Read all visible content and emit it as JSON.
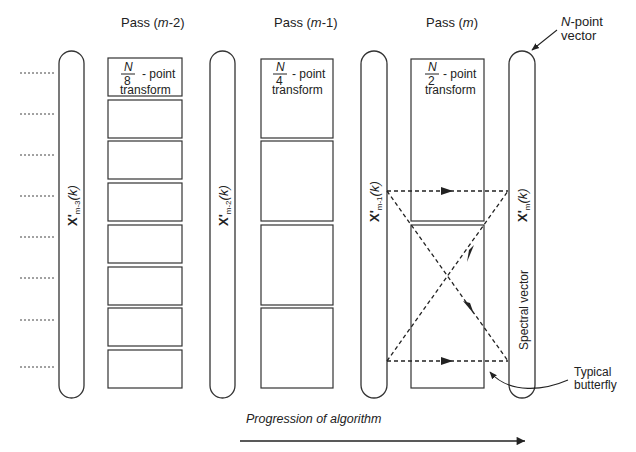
{
  "passes": [
    {
      "label": "Pass (m-2)",
      "prefix": "Pass ",
      "arg": "m",
      "suffix": "-2",
      "transform_num": "N",
      "transform_den": "8",
      "transform_word": "- point",
      "transform_line2": "transform"
    },
    {
      "label": "Pass (m-1)",
      "prefix": "Pass ",
      "arg": "m",
      "suffix": "-1",
      "transform_num": "N",
      "transform_den": "4",
      "transform_word": "- point",
      "transform_line2": "transform"
    },
    {
      "label": "Pass (m)",
      "prefix": "Pass ",
      "arg": "m",
      "suffix": "",
      "transform_num": "N",
      "transform_den": "2",
      "transform_word": "- point",
      "transform_line2": "transform"
    }
  ],
  "vectors": [
    {
      "main": "X'",
      "sub": "m-3",
      "arg": "(k)"
    },
    {
      "main": "X'",
      "sub": "m-2",
      "arg": "(k)"
    },
    {
      "main": "X'",
      "sub": "m-1",
      "arg": "(k)"
    },
    {
      "main": "X'",
      "sub": "m",
      "arg": "(k)",
      "extra": "Spectral vector"
    }
  ],
  "annotations": {
    "n_point_vector": {
      "italic": "N",
      "line1": "-point",
      "line2": "vector"
    },
    "typical_butterfly": {
      "line1": "Typical",
      "line2": "butterfly"
    },
    "progression": "Progression of algorithm"
  },
  "layout": {
    "box_counts": [
      8,
      4,
      2
    ],
    "input_lines": 8
  }
}
